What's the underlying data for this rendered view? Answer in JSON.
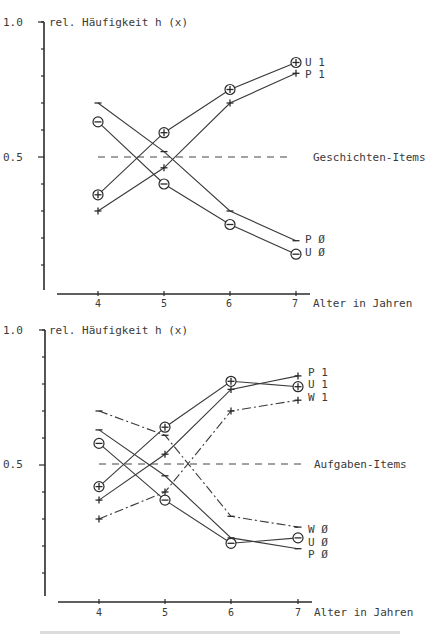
{
  "chart_data": [
    {
      "type": "line",
      "title": "Geschichten-Items",
      "ylabel": "rel. Häufigkeit h (x)",
      "xlabel": "Alter in Jahren",
      "categories": [
        "4",
        "5",
        "6",
        "7"
      ],
      "x": [
        4,
        5,
        6,
        7
      ],
      "ylim": [
        0.0,
        1.0
      ],
      "yticks_labeled": [
        "1.0",
        "0.5"
      ],
      "reference_line": {
        "y": 0.5,
        "style": "dashed",
        "label": "Geschichten-Items"
      },
      "grid": false,
      "legend_position": "line-end labels",
      "series": [
        {
          "name": "U 1",
          "marker": "circle-plus",
          "style": "solid",
          "values": [
            0.36,
            0.59,
            0.75,
            0.85
          ]
        },
        {
          "name": "P 1",
          "marker": "plus",
          "style": "solid",
          "values": [
            0.3,
            0.46,
            0.7,
            0.81
          ]
        },
        {
          "name": "P Ø",
          "marker": "minus",
          "style": "solid",
          "values": [
            0.7,
            0.52,
            0.3,
            0.19
          ]
        },
        {
          "name": "U Ø",
          "marker": "circle-minus",
          "style": "solid",
          "values": [
            0.63,
            0.4,
            0.25,
            0.14
          ]
        }
      ]
    },
    {
      "type": "line",
      "title": "Aufgaben-Items",
      "ylabel": "rel. Häufigkeit h (x)",
      "xlabel": "Alter in Jahren",
      "categories": [
        "4",
        "5",
        "6",
        "7"
      ],
      "x": [
        4,
        5,
        6,
        7
      ],
      "ylim": [
        0.0,
        1.0
      ],
      "yticks_labeled": [
        "1.0",
        "0.5"
      ],
      "reference_line": {
        "y": 0.5,
        "style": "dashed",
        "label": "Aufgaben-Items"
      },
      "grid": false,
      "legend_position": "line-end labels",
      "series": [
        {
          "name": "P 1",
          "marker": "plus",
          "style": "solid",
          "values": [
            0.37,
            0.54,
            0.78,
            0.83
          ]
        },
        {
          "name": "U 1",
          "marker": "circle-plus",
          "style": "solid",
          "values": [
            0.42,
            0.64,
            0.81,
            0.79
          ]
        },
        {
          "name": "W 1",
          "marker": "plus",
          "style": "dash-dot",
          "values": [
            0.3,
            0.4,
            0.7,
            0.74
          ]
        },
        {
          "name": "W Ø",
          "marker": "minus",
          "style": "dash-dot",
          "values": [
            0.7,
            0.61,
            0.31,
            0.27
          ]
        },
        {
          "name": "U Ø",
          "marker": "circle-minus",
          "style": "solid",
          "values": [
            0.58,
            0.37,
            0.21,
            0.23
          ]
        },
        {
          "name": "P Ø",
          "marker": "minus",
          "style": "solid",
          "values": [
            0.63,
            0.46,
            0.23,
            0.19
          ]
        }
      ]
    }
  ],
  "charts": [
    {
      "y_top_label": "1.0",
      "y_mid_label": "0.5",
      "ylabel": "rel. Häufigkeit h (x)",
      "xlabel": "Alter in Jahren",
      "x_ticks": [
        "4",
        "5",
        "6",
        "7"
      ],
      "ref_label": "Geschichten-Items",
      "end_labels": [
        "U 1",
        "P 1",
        "P Ø",
        "U Ø"
      ]
    },
    {
      "y_top_label": "1.0",
      "y_mid_label": "0.5",
      "ylabel": "rel. Häufigkeit h (x)",
      "xlabel": "Alter in Jahren",
      "x_ticks": [
        "4",
        "5",
        "6",
        "7"
      ],
      "ref_label": "Aufgaben-Items",
      "end_labels": [
        "P 1",
        "U 1",
        "W 1",
        "W Ø",
        "U Ø",
        "P Ø"
      ]
    }
  ]
}
